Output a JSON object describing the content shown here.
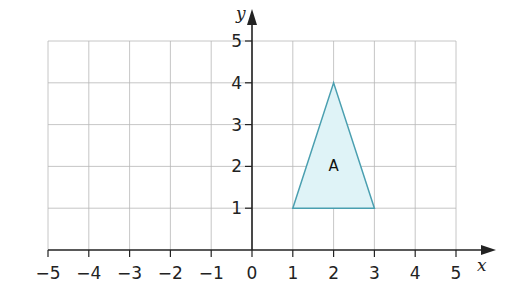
{
  "chart_data": {
    "type": "scatter",
    "title": "",
    "xlabel": "x",
    "ylabel": "y",
    "xlim": [
      -5,
      5
    ],
    "ylim": [
      0,
      5
    ],
    "grid": true,
    "x_ticks": [
      "−5",
      "−4",
      "−3",
      "−2",
      "−1",
      "0",
      "1",
      "2",
      "3",
      "4",
      "5"
    ],
    "y_ticks": [
      "1",
      "2",
      "3",
      "4",
      "5"
    ],
    "shapes": [
      {
        "name": "A",
        "kind": "triangle",
        "vertices": [
          [
            1,
            1
          ],
          [
            2,
            4
          ],
          [
            3,
            1
          ]
        ],
        "label_position": [
          2,
          2
        ]
      }
    ]
  },
  "colors": {
    "grid": "#b8b8b8",
    "axis": "#222222",
    "shape_fill": "#dff3f7",
    "shape_stroke": "#4a9fb0"
  }
}
